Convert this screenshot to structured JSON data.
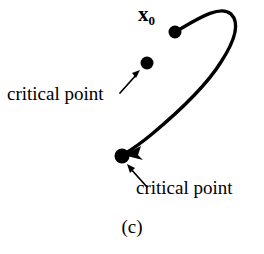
{
  "figure": {
    "caption": "(c)",
    "background_color": "#ffffff",
    "stroke_color": "#000000",
    "width": 264,
    "height": 254,
    "labels": {
      "initial_point": "x",
      "initial_point_subscript": "0",
      "critical_point_upper": "critical point",
      "critical_point_lower": "critical point"
    },
    "points": [
      {
        "name": "initial-point",
        "label": "x0",
        "x": 175,
        "y": 32,
        "radius": 6.5,
        "color": "#000000"
      },
      {
        "name": "critical-point-upper",
        "label": "critical point",
        "x": 147,
        "y": 63,
        "radius": 6.5,
        "color": "#000000"
      },
      {
        "name": "critical-point-lower",
        "label": "critical point",
        "x": 122,
        "y": 156,
        "radius": 7.5,
        "color": "#000000"
      }
    ],
    "trajectory": {
      "name": "trajectory-curve",
      "description": "curve from initial point x0 arcing up and right then descending to lower critical point",
      "start": [
        175,
        32
      ],
      "end": [
        122,
        156
      ],
      "stroke_width": 3.4,
      "path": "M 175 32 C 196 20, 220 4, 231 14 C 241 24, 234 42, 221 62 C 206 86, 176 114, 152 134 C 140 144, 131 150, 124 154",
      "arrowhead": {
        "x": 124,
        "y": 154,
        "angle_deg": 219,
        "length": 17,
        "width": 9
      }
    },
    "leader_arrows": [
      {
        "name": "leader-arrow-upper",
        "from": [
          121,
          92
        ],
        "to": [
          140,
          71
        ],
        "stroke_width": 1.6,
        "head_length": 8,
        "head_width": 5
      },
      {
        "name": "leader-arrow-lower",
        "from": [
          146,
          186
        ],
        "to": [
          127,
          165
        ],
        "stroke_width": 1.6,
        "head_length": 8,
        "head_width": 5
      }
    ]
  }
}
